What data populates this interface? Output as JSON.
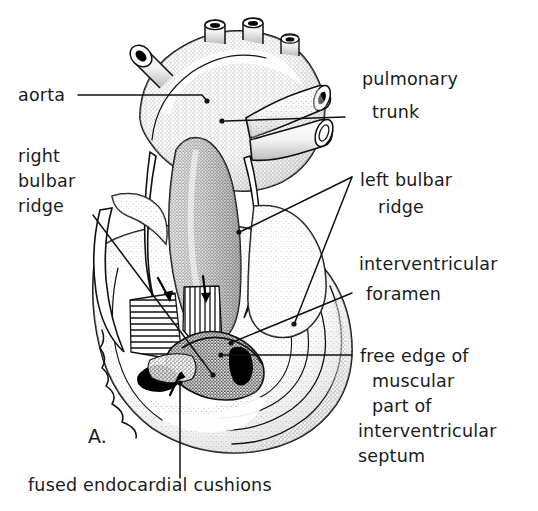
{
  "figure": {
    "panel_letter": "A.",
    "background_color": "#ffffff",
    "ink_color": "#111111",
    "illustration_style": "stippled pen-and-ink anatomical line drawing"
  },
  "labels": {
    "aorta": {
      "lines": [
        "aorta"
      ],
      "x": 18,
      "y": 101,
      "anchor": "start"
    },
    "right_bulbar_ridge": {
      "lines": [
        "right",
        "bulbar",
        "ridge"
      ],
      "x": 18,
      "y": 162,
      "anchor": "start"
    },
    "pulmonary_trunk": {
      "lines": [
        "pulmonary",
        "trunk"
      ],
      "x": 362,
      "y": 85,
      "anchor": "start"
    },
    "left_bulbar_ridge": {
      "lines": [
        "left bulbar",
        "ridge"
      ],
      "x": 362,
      "y": 186,
      "anchor": "start"
    },
    "interventricular_foramen": {
      "lines": [
        "interventricular",
        "foramen"
      ],
      "x": 359,
      "y": 270,
      "anchor": "start"
    },
    "free_edge_septum": {
      "lines": [
        "free edge of",
        "muscular",
        "part of",
        "interventricular",
        "septum"
      ],
      "x": 359,
      "y": 359,
      "anchor": "start"
    },
    "fused_endocardial_cushions": {
      "lines": [
        "fused endocardial cushions"
      ],
      "x": 28,
      "y": 487,
      "anchor": "start"
    }
  },
  "leader_lines": {
    "aorta": {
      "points": "78,95 202,95 207,101",
      "dot": [
        207,
        101
      ]
    },
    "right_bulbar_ridge": {
      "points": "93,215 213,375",
      "dot": [
        213,
        375
      ]
    },
    "pulmonary_trunk": {
      "points": "345,117 225,121",
      "dot": [
        222,
        121
      ]
    },
    "left_bulbar_ridge_upper": {
      "points": "352,177 242,231",
      "dot": [
        239,
        232
      ]
    },
    "left_bulbar_ridge_lower": {
      "points": "352,177 295,322",
      "dot": [
        294,
        324
      ]
    },
    "interventricular_foramen": {
      "points": "352,293 233,342",
      "dot": [
        231,
        343
      ]
    },
    "free_edge_septum": {
      "points": "352,355 224,355",
      "dot": [
        221,
        355
      ]
    },
    "fused_endocardial_cushions": {
      "points": "180,478 180,384",
      "dot": [
        180,
        383
      ]
    }
  },
  "annotation_arrows": {
    "count": 3,
    "description": "small solid arrows indicating ridge fusion and cushion direction",
    "positions": [
      {
        "name": "arrow-right-ridge",
        "x": 164,
        "y": 290
      },
      {
        "name": "arrow-left-ridge",
        "x": 204,
        "y": 288
      },
      {
        "name": "arrow-cushion",
        "x": 176,
        "y": 382
      }
    ]
  },
  "hatched_regions": {
    "right_ridge": {
      "name": "right-bulbar-ridge-hatch",
      "orientation": "horizontal"
    },
    "left_ridge": {
      "name": "left-bulbar-ridge-hatch",
      "orientation": "vertical"
    }
  }
}
